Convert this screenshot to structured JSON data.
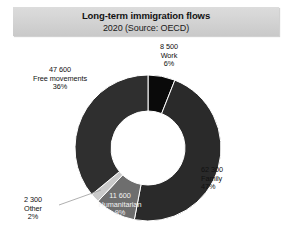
{
  "header": {
    "title": "Long-term immigration flows",
    "subtitle": "2020 (Source: OECD)"
  },
  "chart_data": {
    "type": "pie",
    "variant": "donut",
    "title": "Long-term immigration flows",
    "subtitle": "2020 (Source: OECD)",
    "source": "OECD",
    "year": "2020",
    "unit": "persons",
    "total_label": "",
    "legend_position": "labels-outside",
    "grid": false,
    "start_angle_deg": 0,
    "direction": "clockwise",
    "categories": [
      "Work",
      "Family",
      "Humanitarian",
      "Other",
      "Free movements"
    ],
    "values": [
      8500,
      62300,
      11600,
      2300,
      47600
    ],
    "percentages": [
      6,
      47,
      9,
      2,
      36
    ],
    "value_labels": [
      "8 500",
      "62 300",
      "11 600",
      "2 300",
      "47 600"
    ],
    "percent_labels": [
      "6%",
      "47%",
      "9%",
      "2%",
      "36%"
    ],
    "colors": [
      "#0a0a0a",
      "#2a2a2a",
      "#6e6e6e",
      "#c9c9c9",
      "#2f2f2f"
    ],
    "slices": [
      {
        "name": "Work",
        "value_label": "8 500",
        "percent_label": "6%",
        "value": 8500,
        "percent": 6,
        "color": "#0a0a0a"
      },
      {
        "name": "Family",
        "value_label": "62 300",
        "percent_label": "47%",
        "value": 62300,
        "percent": 47,
        "color": "#2a2a2a"
      },
      {
        "name": "Humanitarian",
        "value_label": "11 600",
        "percent_label": "9%",
        "value": 11600,
        "percent": 9,
        "color": "#6e6e6e"
      },
      {
        "name": "Other",
        "value_label": "2 300",
        "percent_label": "2%",
        "value": 2300,
        "percent": 2,
        "color": "#c9c9c9"
      },
      {
        "name": "Free movements",
        "value_label": "47 600",
        "percent_label": "36%",
        "value": 47600,
        "percent": 36,
        "color": "#2f2f2f"
      }
    ]
  }
}
